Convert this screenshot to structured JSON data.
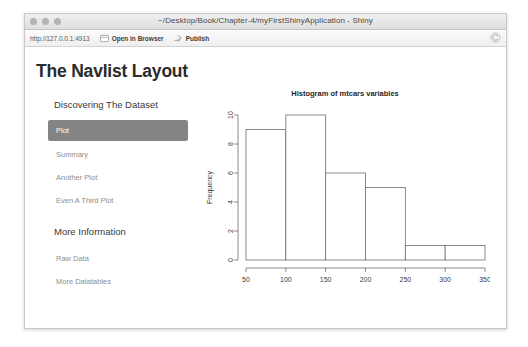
{
  "window": {
    "title": "~/Desktop/Book/Chapter-4/myFirstShinyApplication - Shiny",
    "traffic_lights": [
      "close-button",
      "minimize-button",
      "zoom-button"
    ]
  },
  "toolbar": {
    "url": "http://127.0.0.1:4913",
    "open_in_browser_label": "Open in Browser",
    "publish_label": "Publish",
    "refresh_icon": "refresh-icon",
    "browser_icon": "browser-window-icon",
    "publish_icon": "publish-arrow-icon"
  },
  "page": {
    "heading": "The Navlist Layout"
  },
  "navlist": {
    "sections": [
      {
        "header": "Discovering The Dataset",
        "items": [
          {
            "label": "Plot",
            "active": true
          },
          {
            "label": "Summary",
            "active": false
          },
          {
            "label": "Another Plot",
            "active": false
          },
          {
            "label": "Even A Third Plot",
            "active": false
          }
        ]
      },
      {
        "header": "More Information",
        "items": [
          {
            "label": "Raw Data",
            "active": false
          },
          {
            "label": "More Datatables",
            "active": false
          }
        ]
      }
    ],
    "active_color": "#848484",
    "active_text_color": "#ffffff"
  },
  "chart_data": {
    "type": "bar",
    "title": "Histogram of mtcars variables",
    "xlabel": "",
    "ylabel": "Frequency",
    "bin_edges": [
      50,
      100,
      150,
      200,
      250,
      300,
      350
    ],
    "categories": [
      "50-100",
      "100-150",
      "150-200",
      "200-250",
      "250-300",
      "300-350"
    ],
    "values": [
      9,
      10,
      6,
      5,
      1,
      1
    ],
    "xlim": [
      50,
      350
    ],
    "ylim": [
      0,
      10
    ],
    "xticks": [
      50,
      100,
      150,
      200,
      250,
      300,
      350
    ],
    "yticks": [
      0,
      2,
      4,
      6,
      8,
      10
    ],
    "grid": false,
    "legend": false,
    "bar_fill": "#ffffff",
    "bar_stroke": "#6e6e6e"
  }
}
